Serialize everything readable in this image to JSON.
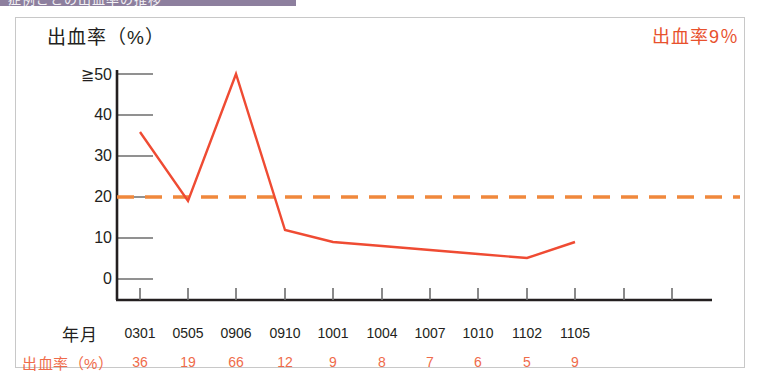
{
  "banner": {
    "text": "症例ごとの出血率の推移",
    "color": "#8d7f9e"
  },
  "chart_title": "出血率（%）",
  "annotation": "出血率9％",
  "axis": {
    "y_label_row_title": "",
    "y_ticks": [
      "≧50",
      "40",
      "30",
      "20",
      "10",
      "0"
    ],
    "y_tick_values": [
      50,
      40,
      30,
      20,
      10,
      0
    ],
    "x_row_label": "年月",
    "value_row_label": "出血率（%）"
  },
  "colors": {
    "line": "#ef4b33",
    "threshold": "#f0883c",
    "axis": "#231f20",
    "value_text": "#ef6b4a",
    "box_border": "#c8c8c8"
  },
  "chart_data": {
    "type": "line",
    "title": "出血率（%）",
    "xlabel": "年月",
    "ylabel": "出血率（%）",
    "categories": [
      "0301",
      "0505",
      "0906",
      "0910",
      "1001",
      "1004",
      "1007",
      "1010",
      "1102",
      "1105"
    ],
    "values": [
      36,
      19,
      66,
      12,
      9,
      8,
      7,
      6,
      5,
      9
    ],
    "plotted_values": [
      36,
      19,
      50,
      12,
      9,
      8,
      7,
      6,
      5,
      9
    ],
    "ylim": [
      0,
      50
    ],
    "y_axis_capped": true,
    "grid": false,
    "legend": null,
    "annotations": [
      {
        "text": "出血率9％",
        "color": "#e8512d",
        "position": "top-right"
      }
    ],
    "reference_line": {
      "value": 20,
      "style": "dashed",
      "color": "#f0883c"
    },
    "data_label_row": {
      "label": "出血率（%）",
      "values": [
        "36",
        "19",
        "66",
        "12",
        "9",
        "8",
        "7",
        "6",
        "5",
        "9"
      ]
    }
  }
}
